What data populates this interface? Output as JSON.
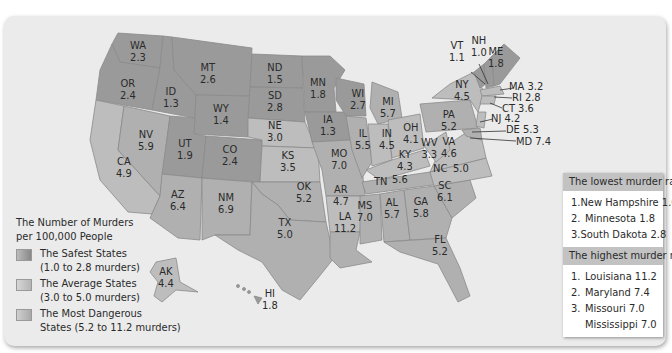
{
  "legend": {
    "title_line1": "The Number of Murders",
    "title_line2": "per 100,000 People",
    "items": [
      {
        "label_line1": "The Safest States",
        "label_line2": "(1.0 to 2.8 murders)",
        "category": "safe"
      },
      {
        "label_line1": "The Average States",
        "label_line2": "(3.0 to 5.0 murders)",
        "category": "average"
      },
      {
        "label_line1": "The Most Dangerous",
        "label_line2": "States (5.2 to 11.2 murders)",
        "category": "dangerous"
      }
    ]
  },
  "states": {
    "WA": {
      "code": "WA",
      "value": "2.3"
    },
    "OR": {
      "code": "OR",
      "value": "2.4"
    },
    "CA": {
      "code": "CA",
      "value": "4.9"
    },
    "ID": {
      "code": "ID",
      "value": "1.3"
    },
    "NV": {
      "code": "NV",
      "value": "5.9"
    },
    "MT": {
      "code": "MT",
      "value": "2.6"
    },
    "WY": {
      "code": "WY",
      "value": "1.4"
    },
    "UT": {
      "code": "UT",
      "value": "1.9"
    },
    "AZ": {
      "code": "AZ",
      "value": "6.4"
    },
    "CO": {
      "code": "CO",
      "value": "2.4"
    },
    "NM": {
      "code": "NM",
      "value": "6.9"
    },
    "ND": {
      "code": "ND",
      "value": "1.5"
    },
    "SD": {
      "code": "SD",
      "value": "2.8"
    },
    "NE": {
      "code": "NE",
      "value": "3.0"
    },
    "KS": {
      "code": "KS",
      "value": "3.5"
    },
    "OK": {
      "code": "OK",
      "value": "5.2"
    },
    "TX": {
      "code": "TX",
      "value": "5.0"
    },
    "MN": {
      "code": "MN",
      "value": "1.8"
    },
    "IA": {
      "code": "IA",
      "value": "1.3"
    },
    "MO": {
      "code": "MO",
      "value": "7.0"
    },
    "AR": {
      "code": "AR",
      "value": "4.7"
    },
    "LA": {
      "code": "LA",
      "value": "11.2"
    },
    "WI": {
      "code": "WI",
      "value": "2.7"
    },
    "IL": {
      "code": "IL",
      "value": "5.5"
    },
    "MI": {
      "code": "MI",
      "value": "5.7"
    },
    "IN": {
      "code": "IN",
      "value": "4.5"
    },
    "OH": {
      "code": "OH",
      "value": "4.1"
    },
    "KY": {
      "code": "KY",
      "value": "4.3"
    },
    "TN": {
      "code": "TN",
      "value": "5.6"
    },
    "MS": {
      "code": "MS",
      "value": "7.0"
    },
    "AL": {
      "code": "AL",
      "value": "5.7"
    },
    "GA": {
      "code": "GA",
      "value": "5.8"
    },
    "FL": {
      "code": "FL",
      "value": "5.2"
    },
    "SC": {
      "code": "SC",
      "value": "6.1"
    },
    "NC": {
      "code": "NC",
      "value": "5.0"
    },
    "VA": {
      "code": "VA",
      "value": "4.6"
    },
    "WV": {
      "code": "WV",
      "value": "3.3"
    },
    "PA": {
      "code": "PA",
      "value": "5.2"
    },
    "NY": {
      "code": "NY",
      "value": "4.5"
    },
    "VT": {
      "code": "VT",
      "value": "1.1"
    },
    "NH": {
      "code": "NH",
      "value": "1.0"
    },
    "ME": {
      "code": "ME",
      "value": "1.8"
    },
    "MA": {
      "code": "MA",
      "value": "3.2"
    },
    "RI": {
      "code": "RI",
      "value": "2.8"
    },
    "CT": {
      "code": "CT",
      "value": "3.6"
    },
    "NJ": {
      "code": "NJ",
      "value": "4.2"
    },
    "DE": {
      "code": "DE",
      "value": "5.3"
    },
    "MD": {
      "code": "MD",
      "value": "7.4"
    },
    "AK": {
      "code": "AK",
      "value": "4.4"
    },
    "HI": {
      "code": "HI",
      "value": "1.8"
    }
  },
  "callouts": {
    "MA": "MA 3.2",
    "RI": "RI 2.8",
    "CT": "CT 3.6",
    "NJ": "NJ 4.2",
    "DE": "DE 5.3",
    "MD": "MD 7.4"
  },
  "lowest": {
    "title": "The lowest murder rates",
    "items": [
      {
        "n": "1.",
        "text": "New Hampshire 1.0"
      },
      {
        "n": "2.",
        "text": "Minnesota 1.8"
      },
      {
        "n": "3.",
        "text": "South Dakota 2.8"
      }
    ]
  },
  "highest": {
    "title": "The highest murder rates",
    "items": [
      {
        "n": "1.",
        "text": "Louisiana 11.2"
      },
      {
        "n": "2.",
        "text": "Maryland 7.4"
      },
      {
        "n": "3.",
        "text": "Missouri 7.0"
      },
      {
        "n": "",
        "text": "Mississippi 7.0"
      }
    ]
  },
  "colors": {
    "panel": "#ebebeb",
    "safe": "#9a9a9a",
    "average": "#bdbdbd",
    "dangerous": "#b0b0b0",
    "box_header": "#c2c2c2"
  }
}
